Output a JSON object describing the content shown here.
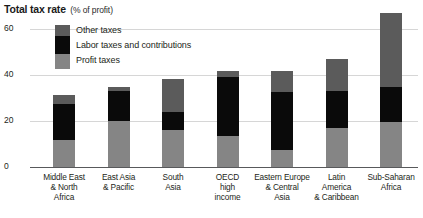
{
  "title": {
    "main": "Total tax rate",
    "sub": "(% of profit)"
  },
  "legend": {
    "items": [
      {
        "label": "Other taxes",
        "color": "#5b5b5b"
      },
      {
        "label": "Labor taxes and contributions",
        "color": "#0a0a0a"
      },
      {
        "label": "Profit taxes",
        "color": "#858585"
      }
    ]
  },
  "axis": {
    "y_ticks": [
      "0",
      "20",
      "40",
      "60"
    ]
  },
  "chart_data": {
    "type": "bar",
    "title": "Total tax rate (% of profit)",
    "xlabel": "",
    "ylabel": "% of profit",
    "ylim": [
      0,
      65
    ],
    "yticks": [
      0,
      20,
      40,
      60
    ],
    "grid": true,
    "stacked": true,
    "legend_position": "top-left-inside",
    "categories": [
      "Middle East & North Africa",
      "East Asia & Pacific",
      "South Asia",
      "OECD high income",
      "Eastern Europe & Central Asia",
      "Latin America & Caribbean",
      "Sub-Saharan Africa"
    ],
    "category_lines": [
      [
        "Middle East",
        "& North",
        "Africa"
      ],
      [
        "East Asia",
        "& Pacific"
      ],
      [
        "South",
        "Asia"
      ],
      [
        "OECD",
        "high",
        "income"
      ],
      [
        "Eastern Europe",
        "& Central",
        "Asia"
      ],
      [
        "Latin",
        "America",
        "& Caribbean"
      ],
      [
        "Sub-Saharan",
        "Africa"
      ]
    ],
    "series": [
      {
        "name": "Profit taxes",
        "values": [
          11.8,
          20.2,
          16.2,
          13.6,
          7.4,
          17.1,
          19.7
        ]
      },
      {
        "name": "Labor taxes and contributions",
        "values": [
          15.8,
          12.7,
          7.5,
          25.4,
          25.0,
          15.8,
          14.9
        ]
      },
      {
        "name": "Other taxes",
        "values": [
          3.5,
          1.8,
          14.5,
          2.6,
          9.2,
          14.0,
          32.5
        ]
      }
    ],
    "totals": [
      31.1,
      34.7,
      38.2,
      41.6,
      41.6,
      46.9,
      67.1
    ]
  }
}
